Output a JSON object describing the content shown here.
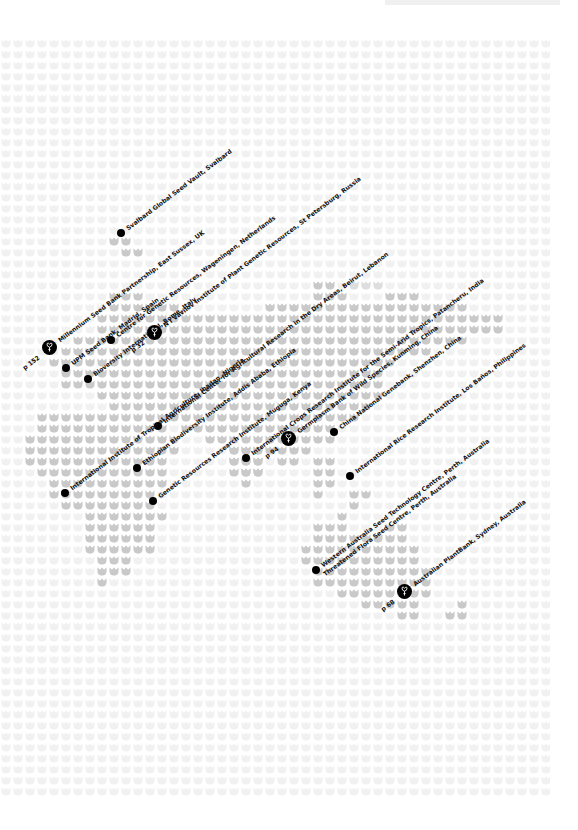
{
  "map": {
    "title": "Global seed bank locations",
    "colors": {
      "ocean_cell": "#f3f3f3",
      "land_cell": "#c8c8c8",
      "marker": "#000000",
      "text": "#111111"
    },
    "grid": {
      "cell_w": 12,
      "cell_h": 11,
      "x0": 0,
      "y0": 38,
      "x1": 550,
      "y1": 796
    }
  },
  "locations": [
    {
      "id": "svalbard",
      "label": "Svalbard Global Seed Vault, Svalbard",
      "type": "dot",
      "x": 121,
      "y": 233
    },
    {
      "id": "millennium",
      "label": "Millennium Seed Bank Partnership, East Sussex, UK",
      "type": "pin",
      "x": 49,
      "y": 347,
      "page_ref": "p 152"
    },
    {
      "id": "upm",
      "label": "UPM Seed Bank, Madrid, Spain",
      "type": "dot",
      "x": 66,
      "y": 368
    },
    {
      "id": "cgn",
      "label": "Centre for Genetic Resources, Wageningen, Netherlands",
      "type": "dot",
      "x": 111,
      "y": 340
    },
    {
      "id": "bioversity",
      "label": "Bioversity International, Rome, Italy",
      "type": "dot",
      "x": 88,
      "y": 379
    },
    {
      "id": "vavilov",
      "label": "N I Vavilov Institute of Plant Genetic Resources, St Petersburg, Russia",
      "type": "pin",
      "x": 154,
      "y": 332,
      "page_ref": "p 32"
    },
    {
      "id": "icarda",
      "label": "International Center for Agricultural Research in the Dry Areas, Beirut, Lebanon",
      "type": "dot",
      "x": 158,
      "y": 426
    },
    {
      "id": "iita",
      "label": "International Institute of Tropical Agriculture, Ibadan, Nigeria",
      "type": "dot",
      "x": 65,
      "y": 493
    },
    {
      "id": "ebi",
      "label": "Ethiopian Biodiversity Institute, Addis Ababa, Ethiopia",
      "type": "dot",
      "x": 137,
      "y": 468
    },
    {
      "id": "gri",
      "label": "Genetic Resources Research Institute, Muguga, Kenya",
      "type": "dot",
      "x": 153,
      "y": 501
    },
    {
      "id": "icrisat",
      "label": "International Crops Research Institute for the Semi-Arid Tropics, Patancheru, India",
      "type": "dot",
      "x": 246,
      "y": 458
    },
    {
      "id": "germplasm",
      "label": "Germplasm Bank of Wild Species, Kunming, China",
      "type": "pin",
      "x": 288,
      "y": 438,
      "page_ref": "p 94"
    },
    {
      "id": "cngb",
      "label": "China National Genebank, Shenzhen, China",
      "type": "dot",
      "x": 334,
      "y": 432
    },
    {
      "id": "irri",
      "label": "International Rice Research Institute, Los Baños, Philippines",
      "type": "dot",
      "x": 350,
      "y": 476
    },
    {
      "id": "wasttc",
      "label": "Western Australia Seed Technology Centre, Perth, Australia",
      "type": "dot",
      "x": 316,
      "y": 570
    },
    {
      "id": "tfsc",
      "label": "Threatened Flora Seed Centre, Perth, Australia",
      "type": "none",
      "x": 324,
      "y": 575
    },
    {
      "id": "plantbank",
      "label": "Australian PlantBank, Sydney, Australia",
      "type": "pin",
      "x": 404,
      "y": 591,
      "page_ref": "p 68"
    }
  ]
}
